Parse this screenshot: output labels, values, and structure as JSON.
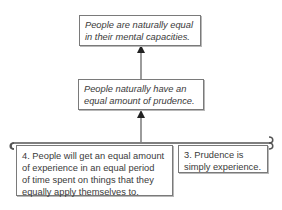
{
  "diagram": {
    "type": "argument-map",
    "nodes": [
      {
        "id": "conclusion",
        "text": "People are naturally equal in their mental capacities.",
        "lines": [
          "People are naturally equal",
          "in their mental capacities."
        ],
        "style": "italic"
      },
      {
        "id": "intermediate",
        "text": "People naturally have an equal amount of prudence.",
        "lines": [
          "People naturally have an",
          "equal amount of prudence."
        ],
        "style": "italic"
      },
      {
        "id": "premise-4",
        "text": "4. People will get an equal amount of experience in an equal period of time spent on things that they equally apply themselves to.",
        "lines": [
          "4. People will get an equal amount",
          "of experience in an equal period",
          "of time spent on things that they",
          "equally apply themselves to."
        ],
        "style": "normal"
      },
      {
        "id": "premise-3",
        "text": "3. Prudence is simply experience.",
        "lines": [
          "3. Prudence is",
          "simply experience."
        ],
        "style": "normal"
      }
    ],
    "edges": [
      {
        "from": "intermediate",
        "to": "conclusion",
        "type": "arrow"
      },
      {
        "from": [
          "premise-4",
          "premise-3"
        ],
        "to": "intermediate",
        "type": "co-premise-bracket-arrow"
      }
    ],
    "colors": {
      "line": "#555555",
      "border": "#7a7a7a",
      "text": "#3a3a3a"
    }
  }
}
